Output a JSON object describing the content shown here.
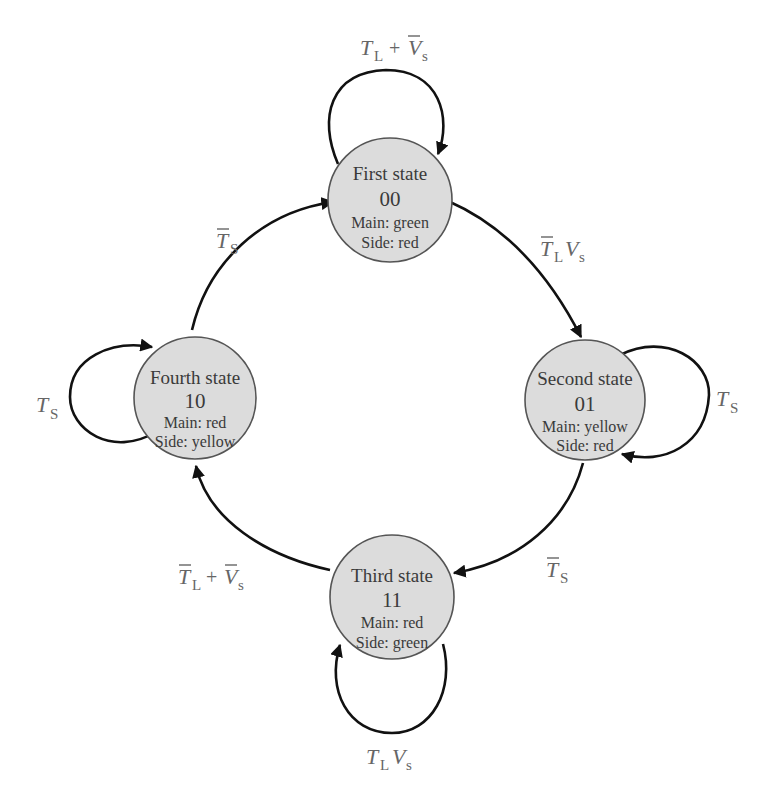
{
  "diagram": {
    "type": "state-machine",
    "title": "",
    "colors": {
      "state_fill": "#dcdcdc",
      "state_stroke": "#555555",
      "edge": "#111111",
      "label": "#666666",
      "text": "#3a3a3a"
    },
    "states": [
      {
        "id": "first",
        "name": "First state",
        "code": "00",
        "main": "Main: green",
        "side": "Side: red"
      },
      {
        "id": "second",
        "name": "Second state",
        "code": "01",
        "main": "Main: yellow",
        "side": "Side: red"
      },
      {
        "id": "third",
        "name": "Third state",
        "code": "11",
        "main": "Main: red",
        "side": "Side: green"
      },
      {
        "id": "fourth",
        "name": "Fourth state",
        "code": "10",
        "main": "Main: red",
        "side": "Side: yellow"
      }
    ],
    "transitions": [
      {
        "from": "first",
        "to": "first",
        "label": "T_L + V̄_s",
        "parts": {
          "a": "T",
          "a_sub": "L",
          "op": "+",
          "b": "V",
          "b_sub": "s"
        }
      },
      {
        "from": "first",
        "to": "second",
        "label": "T̄_L V_s",
        "parts": {
          "a": "T",
          "a_sub": "L",
          "b": "V",
          "b_sub": "s"
        }
      },
      {
        "from": "second",
        "to": "second",
        "label": "T_S",
        "parts": {
          "a": "T",
          "a_sub": "S"
        }
      },
      {
        "from": "second",
        "to": "third",
        "label": "T̄_S",
        "parts": {
          "a": "T",
          "a_sub": "S"
        }
      },
      {
        "from": "third",
        "to": "third",
        "label": "T_L V_s",
        "parts": {
          "a": "T",
          "a_sub": "L",
          "b": "V",
          "b_sub": "s"
        }
      },
      {
        "from": "third",
        "to": "fourth",
        "label": "T̄_L + V̄_s",
        "parts": {
          "a": "T",
          "a_sub": "L",
          "op": "+",
          "b": "V",
          "b_sub": "s"
        }
      },
      {
        "from": "fourth",
        "to": "fourth",
        "label": "T_S",
        "parts": {
          "a": "T",
          "a_sub": "S"
        }
      },
      {
        "from": "fourth",
        "to": "first",
        "label": "T̄_S",
        "parts": {
          "a": "T",
          "a_sub": "S"
        }
      }
    ]
  }
}
